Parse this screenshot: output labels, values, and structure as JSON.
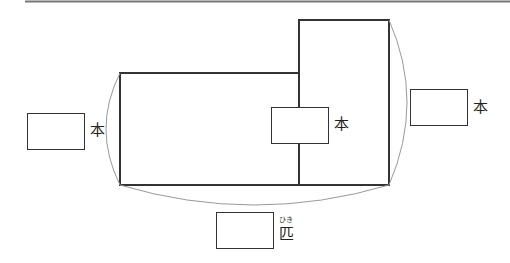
{
  "diagram": {
    "unit_hon": "本",
    "unit_hiki": "匹",
    "hiki_reading": "ひき",
    "answer_boxes": [
      {
        "id": "left",
        "value": ""
      },
      {
        "id": "middle",
        "value": ""
      },
      {
        "id": "right",
        "value": ""
      },
      {
        "id": "bottom",
        "value": ""
      }
    ],
    "colors": {
      "line": "#333333",
      "arc": "#999999",
      "top_rule": "#777777"
    }
  }
}
